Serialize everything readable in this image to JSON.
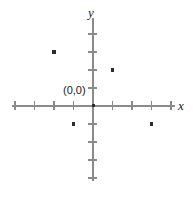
{
  "figure": {
    "background_color": "#ffffff",
    "axis_color": "#8a8a8a",
    "point_color": "#2b2b2b",
    "text_color": "#1a1a1a",
    "origin_label": "(0,0)",
    "x_axis_label": "x",
    "y_axis_label": "y"
  },
  "chart_data": {
    "type": "scatter",
    "title": "",
    "xlabel": "x",
    "ylabel": "y",
    "grid": false,
    "legend": "none",
    "xlim": [
      -4.5,
      4.5
    ],
    "ylim": [
      -4.5,
      4.5
    ],
    "x_ticks": [
      -4,
      -3,
      -2,
      -1,
      1,
      2,
      3,
      4
    ],
    "y_ticks": [
      -4,
      -3,
      -2,
      -1,
      1,
      2,
      3,
      4
    ],
    "tick_labels_shown": false,
    "origin_marked": true,
    "origin_label": "(0,0)",
    "points": [
      {
        "x": -2,
        "y": 3
      },
      {
        "x": 1,
        "y": 2
      },
      {
        "x": -1,
        "y": -1
      },
      {
        "x": 3,
        "y": -1
      }
    ],
    "annotations": [
      {
        "text": "(0,0)",
        "x": 0,
        "y": 0
      }
    ]
  },
  "geometry": {
    "origin_px": {
      "x": 93,
      "y": 106
    },
    "unit_px": {
      "x": 19.5,
      "y": 18.0
    }
  }
}
